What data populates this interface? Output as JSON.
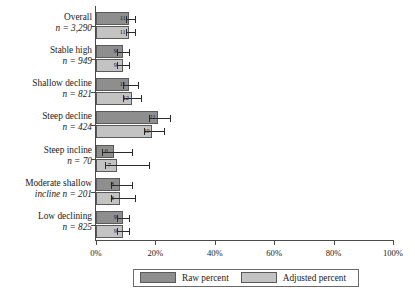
{
  "chart_data": {
    "type": "bar",
    "orientation": "horizontal",
    "title": "",
    "xlabel": "",
    "ylabel": "",
    "xlim": [
      0,
      100
    ],
    "xticks": [
      0,
      20,
      40,
      60,
      80,
      100
    ],
    "xticklabels": [
      "0%",
      "20%",
      "40%",
      "60%",
      "80%",
      "100%"
    ],
    "grid": false,
    "legend_position": "bottom",
    "categories": [
      "Overall",
      "Stable high",
      "Shallow decline",
      "Steep decline",
      "Steep incline",
      "Moderate shallow incline",
      "Low declining"
    ],
    "category_n": [
      "n = 3,290",
      "n = 949",
      "n = 821",
      "n = 424",
      "n = 70",
      "n = 201",
      "n = 825"
    ],
    "series": [
      {
        "name": "Raw percent",
        "color": "#8e8e8e",
        "values": [
          11,
          9,
          11,
          21,
          6,
          8,
          9
        ],
        "labels": [
          "11",
          "9",
          "11",
          "21",
          "6",
          "8",
          "9"
        ],
        "ci_low": [
          10,
          7,
          9,
          18,
          2,
          5,
          7
        ],
        "ci_high": [
          13,
          11,
          14,
          25,
          12,
          12,
          11
        ]
      },
      {
        "name": "Adjusted percent",
        "color": "#c3c3c3",
        "values": [
          11,
          9,
          12,
          19,
          7,
          8,
          9
        ],
        "labels": [
          "11",
          "9",
          "12",
          "19",
          "7",
          "8",
          "9"
        ],
        "ci_low": [
          10,
          7,
          9,
          16,
          3,
          5,
          7
        ],
        "ci_high": [
          13,
          11,
          15,
          23,
          18,
          13,
          11
        ]
      }
    ]
  },
  "legend": {
    "raw_label": "Raw percent",
    "adjusted_label": "Adjusted percent"
  },
  "axis": {
    "tick_0": "0%",
    "tick_20": "20%",
    "tick_40": "40%",
    "tick_60": "60%",
    "tick_80": "80%",
    "tick_100": "100%"
  },
  "categories": {
    "c0_name": "Overall",
    "c0_n": "n = 3,290",
    "c1_name": "Stable high",
    "c1_n": "n = 949",
    "c2_name": "Shallow decline",
    "c2_n": "n = 821",
    "c3_name": "Steep decline",
    "c3_n": "n = 424",
    "c4_name": "Steep incline",
    "c4_n": "n = 70",
    "c5_name": "Moderate shallow",
    "c5_n": "incline n = 201",
    "c6_name": "Low declining",
    "c6_n": "n = 825"
  }
}
